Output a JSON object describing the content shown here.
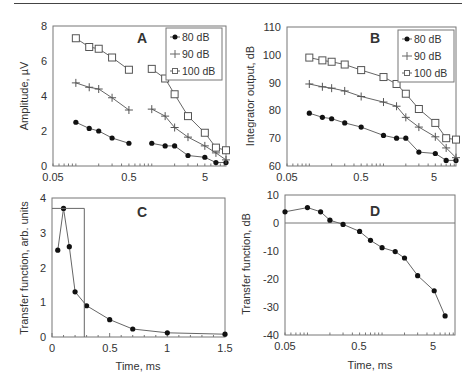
{
  "chart_data": [
    {
      "panel": "A",
      "type": "line",
      "title": "A",
      "xlabel": "",
      "ylabel": "Amplitude, µV",
      "xscale": "log",
      "xlim": [
        0.05,
        9.5
      ],
      "ylim": [
        0,
        8
      ],
      "xticks": [
        "0.05",
        "0.5",
        "5"
      ],
      "yticks": [
        "0",
        "2",
        "4",
        "6",
        "8"
      ],
      "legend": [
        "80 dB",
        "90 dB",
        "100 dB"
      ],
      "legend_position": "upper right",
      "series": [
        {
          "name": "80 dB",
          "marker": "filled-circle",
          "segments": [
            {
              "x": [
                0.1,
                0.15,
                0.2,
                0.3,
                0.5
              ],
              "y": [
                2.5,
                2.15,
                2.0,
                1.6,
                1.3
              ]
            },
            {
              "x": [
                1,
                1.5,
                2,
                3,
                5,
                7,
                9.5
              ],
              "y": [
                1.3,
                1.15,
                1.15,
                0.6,
                0.5,
                0.2,
                0.2
              ]
            }
          ]
        },
        {
          "name": "90 dB",
          "marker": "plus",
          "segments": [
            {
              "x": [
                0.1,
                0.15,
                0.2,
                0.3,
                0.5
              ],
              "y": [
                4.75,
                4.5,
                4.4,
                3.9,
                3.2
              ]
            },
            {
              "x": [
                1,
                1.5,
                2,
                3,
                5,
                7,
                9.5
              ],
              "y": [
                3.25,
                2.85,
                2.2,
                1.65,
                1.15,
                0.75,
                0.35
              ]
            }
          ]
        },
        {
          "name": "100 dB",
          "marker": "open-square",
          "segments": [
            {
              "x": [
                0.1,
                0.15,
                0.2,
                0.3,
                0.5
              ],
              "y": [
                7.3,
                6.8,
                6.7,
                6.2,
                5.5
              ]
            },
            {
              "x": [
                1,
                1.5,
                2,
                3,
                5,
                7,
                9.5
              ],
              "y": [
                5.55,
                5.0,
                4.1,
                2.85,
                1.9,
                1.05,
                0.9
              ]
            }
          ]
        }
      ]
    },
    {
      "panel": "B",
      "type": "line",
      "title": "B",
      "xlabel": "",
      "ylabel": "Integrator output, dB",
      "xscale": "log",
      "xlim": [
        0.05,
        9.5
      ],
      "ylim": [
        60,
        110
      ],
      "xticks": [
        "0.05",
        "0.5",
        "5"
      ],
      "yticks": [
        "60",
        "70",
        "80",
        "90",
        "100",
        "110"
      ],
      "legend": [
        "80 dB",
        "90 dB",
        "100 dB"
      ],
      "legend_position": "upper right",
      "series": [
        {
          "name": "80 dB",
          "marker": "filled-circle",
          "x": [
            0.1,
            0.15,
            0.2,
            0.3,
            0.5,
            1,
            1.5,
            2,
            3,
            5,
            7,
            9.5
          ],
          "y": [
            79,
            77.5,
            77,
            75.5,
            74,
            71,
            70,
            70,
            65,
            64.5,
            62,
            62
          ]
        },
        {
          "name": "90 dB",
          "marker": "plus",
          "x": [
            0.1,
            0.15,
            0.2,
            0.3,
            0.5,
            1,
            1.5,
            2,
            3,
            5,
            7,
            9.5
          ],
          "y": [
            89.5,
            88.5,
            88,
            87,
            85,
            83,
            81.5,
            77.5,
            74,
            70.5,
            66.5,
            63
          ]
        },
        {
          "name": "100 dB",
          "marker": "open-square",
          "x": [
            0.1,
            0.15,
            0.2,
            0.3,
            0.5,
            1,
            1.5,
            2,
            3,
            5,
            7,
            9.5
          ],
          "y": [
            99,
            98,
            97.5,
            96.5,
            94.5,
            92,
            89.5,
            86,
            80.5,
            75.5,
            70,
            69.5
          ]
        }
      ]
    },
    {
      "panel": "C",
      "type": "line",
      "title": "C",
      "xlabel": "Time, ms",
      "ylabel": "Transfer function, arb. units",
      "xscale": "linear",
      "xlim": [
        0,
        1.5
      ],
      "ylim": [
        0,
        4
      ],
      "xticks": [
        "0",
        "0.5",
        "1",
        "1.5"
      ],
      "yticks": [
        "0",
        "1",
        "2",
        "3",
        "4"
      ],
      "series": [
        {
          "name": "transfer function",
          "marker": "filled-circle",
          "x": [
            0.05,
            0.1,
            0.15,
            0.2,
            0.3,
            0.5,
            0.7,
            1.0,
            1.5
          ],
          "y": [
            2.5,
            3.7,
            2.6,
            1.3,
            0.9,
            0.5,
            0.23,
            0.12,
            0.08
          ]
        },
        {
          "name": "rectangular window",
          "marker": "none",
          "x": [
            0,
            0.28,
            0.28
          ],
          "y": [
            3.7,
            3.7,
            0
          ]
        }
      ]
    },
    {
      "panel": "D",
      "type": "line",
      "title": "D",
      "xlabel": "Time, ms",
      "ylabel": "Transfer function, dB",
      "xscale": "log",
      "xlim": [
        0.05,
        9.5
      ],
      "ylim": [
        -40,
        10
      ],
      "xticks": [
        "0.05",
        "0.5",
        "5"
      ],
      "yticks": [
        "-40",
        "-30",
        "-20",
        "-10",
        "0",
        "10"
      ],
      "reference_line_y": 0,
      "series": [
        {
          "name": "transfer function",
          "marker": "filled-circle",
          "x": [
            0.05,
            0.1,
            0.15,
            0.2,
            0.3,
            0.5,
            0.7,
            1.0,
            1.5,
            2,
            3,
            5,
            7
          ],
          "y": [
            4,
            5.5,
            4,
            1,
            -0.5,
            -3,
            -6.2,
            -8.8,
            -10.2,
            -12.5,
            -18.8,
            -24.2,
            -33.2
          ]
        }
      ]
    }
  ],
  "labels": {
    "A": {
      "letter": "A",
      "ylabel": "Amplitude, µV",
      "yticks": [
        "0",
        "2",
        "4",
        "6",
        "8"
      ],
      "xticks": [
        "0.05",
        "0.5",
        "5"
      ],
      "legend": [
        "80 dB",
        "90 dB",
        "100 dB"
      ]
    },
    "B": {
      "letter": "B",
      "ylabel": "Integrator output, dB",
      "yticks": [
        "60",
        "70",
        "80",
        "90",
        "100",
        "110"
      ],
      "xticks": [
        "0.05",
        "0.5",
        "5"
      ],
      "legend": [
        "80 dB",
        "90 dB",
        "100 dB"
      ]
    },
    "C": {
      "letter": "C",
      "ylabel": "Transfer function, arb. units",
      "xlabel": "Time, ms",
      "yticks": [
        "0",
        "1",
        "2",
        "3",
        "4"
      ],
      "xticks": [
        "0",
        "0.5",
        "1",
        "1.5"
      ]
    },
    "D": {
      "letter": "D",
      "ylabel": "Transfer function, dB",
      "xlabel": "Time, ms",
      "yticks": [
        "-40",
        "-30",
        "-20",
        "-10",
        "0",
        "10"
      ],
      "xticks": [
        "0.05",
        "0.5",
        "5"
      ]
    }
  },
  "colors": {
    "axis": "#555555",
    "line": "#666666",
    "marker": "#111111",
    "text": "#333333"
  }
}
